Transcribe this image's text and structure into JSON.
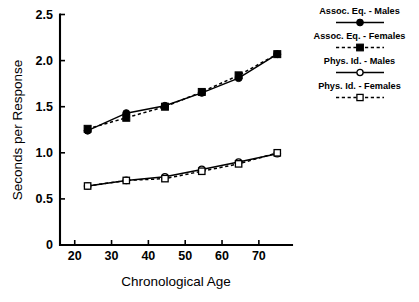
{
  "chart_data": {
    "type": "line",
    "title": "",
    "xlabel": "Chronological Age",
    "ylabel": "Seconds per Response",
    "xlim": [
      16,
      79
    ],
    "ylim": [
      0,
      2.5
    ],
    "xticks": [
      "20",
      "30",
      "40",
      "50",
      "60",
      "70"
    ],
    "xtick_values": [
      20,
      30,
      40,
      50,
      60,
      70
    ],
    "yticks": [
      "0",
      "0.5",
      "1.0",
      "1.5",
      "2.0",
      "2.5"
    ],
    "ytick_values": [
      0,
      0.5,
      1.0,
      1.5,
      2.0,
      2.5
    ],
    "grid": false,
    "legend_position": "right",
    "x": [
      23.5,
      34,
      44.5,
      54.5,
      64.5,
      75
    ],
    "series": [
      {
        "name": "Assoc. Eq. - Males",
        "marker": "filled-circle",
        "line": "solid",
        "values": [
          1.24,
          1.43,
          1.51,
          1.65,
          1.81,
          2.07
        ]
      },
      {
        "name": "Assoc. Eq. - Females",
        "marker": "filled-square",
        "line": "dashed",
        "values": [
          1.26,
          1.38,
          1.5,
          1.66,
          1.84,
          2.07
        ]
      },
      {
        "name": "Phys. Id. - Males",
        "marker": "open-circle",
        "line": "solid",
        "values": [
          0.64,
          0.7,
          0.74,
          0.82,
          0.9,
          0.99
        ]
      },
      {
        "name": "Phys. Id. - Females",
        "marker": "open-square",
        "line": "dashed",
        "values": [
          0.64,
          0.7,
          0.72,
          0.8,
          0.88,
          1.0
        ]
      }
    ]
  },
  "legend": {
    "entries": [
      {
        "label": "Assoc. Eq. - Males"
      },
      {
        "label": "Assoc. Eq. - Females"
      },
      {
        "label": "Phys. Id. - Males"
      },
      {
        "label": "Phys. Id. - Females"
      }
    ]
  },
  "axes": {
    "x_title": "Chronological Age",
    "y_title": "Seconds per Response"
  },
  "colors": {
    "ink": "#000000",
    "background": "#ffffff"
  }
}
